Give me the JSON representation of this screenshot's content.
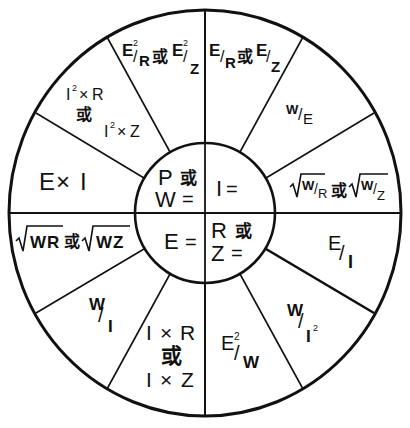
{
  "diagram": {
    "or_word": "或",
    "colors": {
      "stroke": "#111111",
      "background": "#ffffff"
    },
    "center_quadrants": {
      "top_left": {
        "line1": "P 或",
        "line2": "W ="
      },
      "top_right": {
        "line1": "I ="
      },
      "bottom_left": {
        "line1": "E ="
      },
      "bottom_right": {
        "line1": "R 或",
        "line2": "Z ="
      }
    },
    "outer_segments": {
      "power": [
        {
          "id": "e2-over-r-or-z",
          "text": "E²/R 或 E²/Z"
        },
        {
          "id": "i2r-or-i2z",
          "line1": "I²×R",
          "line2": "或",
          "line3": "I²×Z"
        },
        {
          "id": "e-times-i",
          "text": "E×I"
        }
      ],
      "current": [
        {
          "id": "e-over-r-or-z",
          "text": "E/R 或 E/Z"
        },
        {
          "id": "w-over-e",
          "text": "W/E"
        },
        {
          "id": "sqrt-w-over-r-or-z",
          "text": "√(W/R) 或 √(W/Z)"
        }
      ],
      "voltage": [
        {
          "id": "sqrt-wr-or-wz",
          "text": "√WR 或 √WZ"
        },
        {
          "id": "w-over-i",
          "text": "W/I"
        },
        {
          "id": "i-times-r-or-z",
          "line1": "I×R",
          "line2": "或",
          "line3": "I×Z"
        }
      ],
      "resistance": [
        {
          "id": "e-over-i",
          "text": "E/I"
        },
        {
          "id": "w-over-i2",
          "text": "W/I²"
        },
        {
          "id": "e2-over-w",
          "text": "E²/W"
        }
      ]
    },
    "glyphs": {
      "E": "E",
      "R": "R",
      "Z": "Z",
      "W": "W",
      "I": "I",
      "times": "×",
      "slash": "/",
      "sq": "2",
      "or": "或",
      "eq": "=",
      "P": "P"
    }
  }
}
